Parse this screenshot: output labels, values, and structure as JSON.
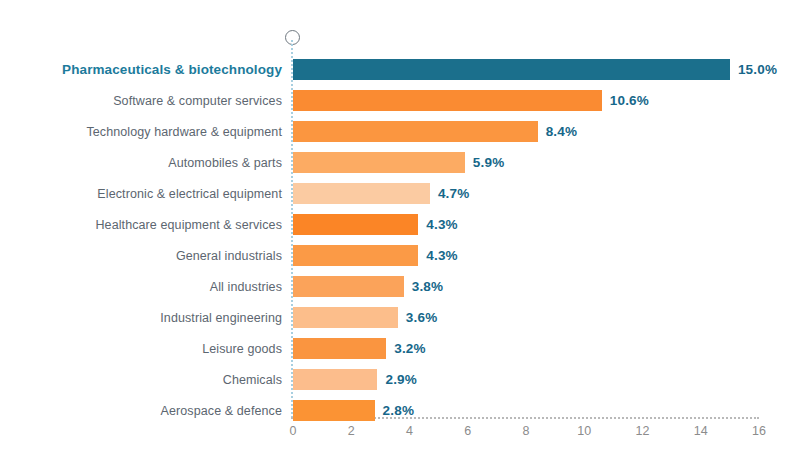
{
  "chart_data": {
    "type": "bar",
    "orientation": "horizontal",
    "title": "",
    "subtitle": "",
    "xlabel": "",
    "ylabel": "",
    "xlim": [
      0,
      16
    ],
    "xticks": [
      "0",
      "2",
      "4",
      "6",
      "8",
      "10",
      "12",
      "14",
      "16"
    ],
    "grid": false,
    "legend": null,
    "value_suffix": "%",
    "highlight_index": 0,
    "colors": {
      "highlight_bar": "#1b6f8c",
      "value_label": "#16678a",
      "highlight_label": "#1c7b9c",
      "category_label": "#5c6670",
      "axis_tick": "#8c8c8c",
      "zero_axis_dotted": "#a8cfe0",
      "x_axis_dotted": "#b9b9b9",
      "background": "#ffffff"
    },
    "categories": [
      "Pharmaceuticals & biotechnology",
      "Software & computer services",
      "Technology hardware & equipment",
      "Automobiles & parts",
      "Electronic & electrical equipment",
      "Healthcare equipment & services",
      "General industrials",
      "All industries",
      "Industrial engineering",
      "Leisure goods",
      "Chemicals",
      "Aerospace & defence"
    ],
    "values": [
      15.0,
      10.6,
      8.4,
      5.9,
      4.7,
      4.3,
      4.3,
      3.8,
      3.6,
      3.2,
      2.9,
      2.8
    ],
    "value_labels": [
      "15.0%",
      "10.6%",
      "8.4%",
      "5.9%",
      "4.7%",
      "4.3%",
      "4.3%",
      "3.8%",
      "3.6%",
      "3.2%",
      "2.9%",
      "2.8%"
    ],
    "bar_colors": [
      "#1b6f8c",
      "#fa8b32",
      "#fb9640",
      "#fcab63",
      "#fbcba2",
      "#fb8526",
      "#fb9a46",
      "#fba35a",
      "#fcbe8b",
      "#fa9540",
      "#fcbd8c",
      "#fb9334"
    ],
    "axis_marker": "open-circle"
  }
}
